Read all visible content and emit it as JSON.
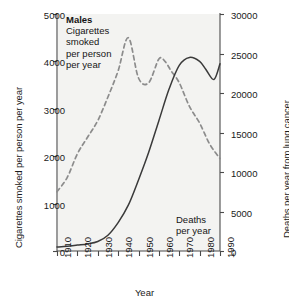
{
  "chart_data": {
    "type": "line",
    "title": "",
    "xlabel": "Year",
    "ylabel": "Cigarettes smoked per person per year",
    "y2label": "Deaths per year from lung cancer",
    "xlim": [
      1910,
      1990
    ],
    "ylim": [
      0,
      5000
    ],
    "y2lim": [
      0,
      30000
    ],
    "xticks": [
      "1910",
      "1920",
      "1930",
      "1940",
      "1950",
      "1960",
      "1970",
      "1980",
      "1990"
    ],
    "yticks": [
      "0",
      "1000",
      "2000",
      "3000",
      "4000",
      "5000"
    ],
    "y2ticks": [
      "0",
      "5000",
      "10000",
      "15000",
      "20000",
      "25000",
      "30000"
    ],
    "grid": false,
    "legend_position": "in-plot-annotations",
    "series": [
      {
        "name": "Cigarettes smoked per person per year",
        "axis": "left",
        "style": "dashed",
        "color": "#8c8c8c",
        "x": [
          1910,
          1915,
          1920,
          1925,
          1930,
          1935,
          1940,
          1945,
          1950,
          1955,
          1960,
          1963,
          1966,
          1970,
          1975,
          1980,
          1985,
          1990
        ],
        "values": [
          1250,
          1550,
          2050,
          2400,
          2750,
          3250,
          3800,
          4500,
          3650,
          3550,
          4050,
          4000,
          3800,
          3550,
          3050,
          2700,
          2250,
          1950
        ]
      },
      {
        "name": "Deaths per year from lung cancer",
        "axis": "right",
        "style": "solid",
        "color": "#3a3a3a",
        "x": [
          1910,
          1915,
          1920,
          1925,
          1930,
          1935,
          1940,
          1945,
          1950,
          1955,
          1960,
          1965,
          1970,
          1975,
          1980,
          1983,
          1987,
          1990
        ],
        "values": [
          500,
          600,
          750,
          900,
          1200,
          2000,
          3600,
          5800,
          9000,
          12500,
          16500,
          20500,
          23500,
          24500,
          24000,
          23000,
          21700,
          23700
        ]
      }
    ],
    "annotations": [
      {
        "id": "males",
        "text": "Males",
        "bold": true
      },
      {
        "id": "cigs_line1",
        "text": "Cigarettes"
      },
      {
        "id": "cigs_line2",
        "text": "smoked"
      },
      {
        "id": "cigs_line3",
        "text": "per person"
      },
      {
        "id": "cigs_line4",
        "text": "per year"
      },
      {
        "id": "deaths_line1",
        "text": "Deaths"
      },
      {
        "id": "deaths_line2",
        "text": "per year"
      }
    ]
  },
  "axes": {
    "left": {
      "title": "Cigarettes smoked per person per year",
      "ticks": [
        "5000",
        "4000",
        "3000",
        "2000",
        "1000",
        "0"
      ]
    },
    "right": {
      "title": "Deaths per year from lung cancer",
      "ticks": [
        "30000",
        "25000",
        "20000",
        "15000",
        "10000",
        "5000",
        "0"
      ]
    },
    "bottom": {
      "title": "Year",
      "ticks": [
        "1910",
        "1920",
        "1930",
        "1940",
        "1950",
        "1960",
        "1970",
        "1980",
        "1990"
      ]
    }
  },
  "annotations": {
    "males": "Males",
    "cigs_line1": "Cigarettes",
    "cigs_line2": "smoked",
    "cigs_line3": "per person",
    "cigs_line4": "per year",
    "deaths_line1": "Deaths",
    "deaths_line2": "per year"
  },
  "colors": {
    "cigarettes_line": "#8c8c8c",
    "deaths_line": "#3a3a3a",
    "axis": "#4a4a4a",
    "text": "#1a1a1a"
  }
}
